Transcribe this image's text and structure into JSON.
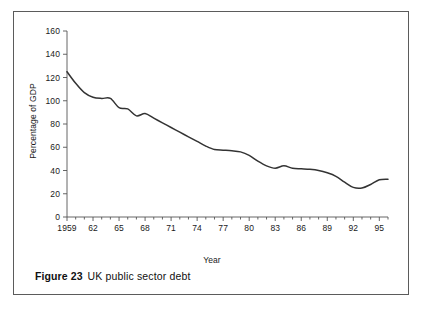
{
  "figure": {
    "caption_label": "Figure 23",
    "caption_title": "UK public sector debt"
  },
  "chart_data": {
    "type": "line",
    "title": "UK public sector debt",
    "xlabel": "Year",
    "ylabel": "Percentage of GDP",
    "xlim": [
      1959,
      1996
    ],
    "ylim": [
      0,
      160
    ],
    "ytick_step": 20,
    "xtick_step": 1,
    "xtick_label_step": 3,
    "grid": false,
    "legend": null,
    "line_color": "#333333",
    "axis_color": "#555555",
    "ytick_labels": [
      "0",
      "20",
      "40",
      "60",
      "80",
      "100",
      "120",
      "140",
      "160"
    ],
    "yticks": [
      0,
      20,
      40,
      60,
      80,
      100,
      120,
      140,
      160
    ],
    "xtick_labels": [
      "1959",
      "62",
      "65",
      "68",
      "71",
      "74",
      "77",
      "80",
      "83",
      "86",
      "89",
      "92",
      "95"
    ],
    "xticks": [
      1959,
      1962,
      1965,
      1968,
      1971,
      1974,
      1977,
      1980,
      1983,
      1986,
      1989,
      1992,
      1995
    ],
    "x": [
      1959,
      1960,
      1961,
      1962,
      1963,
      1964,
      1965,
      1966,
      1967,
      1968,
      1969,
      1970,
      1971,
      1972,
      1973,
      1974,
      1975,
      1976,
      1977,
      1978,
      1979,
      1980,
      1981,
      1982,
      1983,
      1984,
      1985,
      1986,
      1987,
      1988,
      1989,
      1990,
      1991,
      1992,
      1993,
      1994,
      1995,
      1996
    ],
    "values": [
      125,
      115,
      107,
      103,
      102,
      102,
      94,
      93,
      87,
      89,
      85,
      81,
      77,
      73,
      69,
      65,
      61,
      58,
      57.5,
      57,
      56,
      53,
      48,
      44,
      42,
      44,
      42,
      41.5,
      41,
      40,
      38,
      35,
      30,
      25.5,
      25,
      28,
      32,
      32.5
    ],
    "annotations": []
  },
  "axes": {
    "y_title": "Percentage of GDP",
    "x_title": "Year"
  }
}
